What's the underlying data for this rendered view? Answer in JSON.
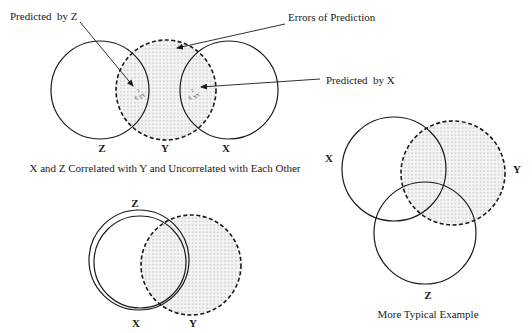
{
  "diagram_top": {
    "name": "uncorrelated-predictors",
    "caption": "X and Z Correlated with Y and Uncorrelated with Each Other",
    "circles": [
      {
        "id": "Z",
        "label": "Z",
        "cx": 100,
        "cy": 90,
        "r": 49,
        "style": "solid"
      },
      {
        "id": "Y",
        "label": "Y",
        "cx": 166,
        "cy": 90,
        "r": 50,
        "style": "dashed-dotted-fill"
      },
      {
        "id": "X",
        "label": "X",
        "cx": 229,
        "cy": 90,
        "r": 49,
        "style": "solid"
      }
    ],
    "annotations": {
      "predicted_by_z": "Predicted  by Z",
      "errors_of_prediction": "Errors of Prediction",
      "predicted_by_x": "Predicted  by X"
    },
    "region_labels": {
      "zy": "ε",
      "zy_sub": "ZY",
      "zy_sup": "2",
      "xy": "ε",
      "xy_sub": "XY",
      "xy_sup": "2"
    }
  },
  "diagram_bottom_left": {
    "name": "collinear-predictors",
    "circles": [
      {
        "id": "Z",
        "label": "Z",
        "cx": 139,
        "cy": 260,
        "r": 50,
        "style": "solid"
      },
      {
        "id": "X",
        "label": "X",
        "cx": 140,
        "cy": 262,
        "r": 46,
        "style": "solid"
      },
      {
        "id": "Y",
        "label": "Y",
        "cx": 191,
        "cy": 265,
        "r": 50,
        "style": "dashed-dotted-fill"
      }
    ]
  },
  "diagram_right": {
    "name": "typical-example",
    "caption": "More Typical Example",
    "circles": [
      {
        "id": "X",
        "label": "X",
        "cx": 394,
        "cy": 169,
        "r": 52,
        "style": "solid"
      },
      {
        "id": "Y",
        "label": "Y",
        "cx": 453,
        "cy": 173,
        "r": 52,
        "style": "dashed-dotted-fill"
      },
      {
        "id": "Z",
        "label": "Z",
        "cx": 425,
        "cy": 233,
        "r": 52,
        "style": "solid"
      }
    ]
  },
  "colors": {
    "stroke": "#1a1a1a",
    "fill_dots": "#8a8a8a",
    "background": "#ffffff"
  }
}
